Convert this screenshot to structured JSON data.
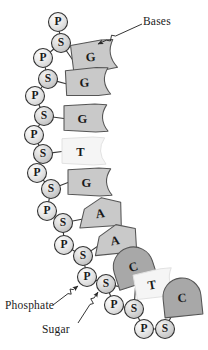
{
  "figure": {
    "background_color": "#ffffff",
    "stroke_color": "#3a3a3a",
    "text_color": "#1a1a1a"
  },
  "annotations": {
    "bases_label": "Bases",
    "phosphate_label": "Phosphate",
    "sugar_label": "Sugar"
  },
  "legend_colors": {
    "purine_fill": "#c9c9c9",
    "pyrimidine_fill": "#a8a8a8",
    "thymine_fill": "#f5f5f5",
    "phosphate_fill": "#e0e0e0",
    "sugar_fill": "#cfcfcf"
  },
  "backbone": [
    {
      "type": "P",
      "label": "P",
      "cx": 58,
      "cy": 22,
      "r": 9.5
    },
    {
      "type": "S",
      "label": "S",
      "cx": 61,
      "cy": 43,
      "r": 9.5
    },
    {
      "type": "P",
      "label": "P",
      "cx": 43,
      "cy": 58,
      "r": 9.5
    },
    {
      "type": "S",
      "label": "S",
      "cx": 48,
      "cy": 79,
      "r": 9.5
    },
    {
      "type": "P",
      "label": "P",
      "cx": 35,
      "cy": 96,
      "r": 9.5
    },
    {
      "type": "S",
      "label": "S",
      "cx": 44,
      "cy": 116,
      "r": 9.5
    },
    {
      "type": "P",
      "label": "P",
      "cx": 34,
      "cy": 135,
      "r": 9.5
    },
    {
      "type": "S",
      "label": "S",
      "cx": 43,
      "cy": 154,
      "r": 9.5
    },
    {
      "type": "P",
      "label": "P",
      "cx": 37,
      "cy": 173,
      "r": 9.5
    },
    {
      "type": "S",
      "label": "S",
      "cx": 51,
      "cy": 189,
      "r": 9.5
    },
    {
      "type": "P",
      "label": "P",
      "cx": 47,
      "cy": 211,
      "r": 9.5
    },
    {
      "type": "S",
      "label": "S",
      "cx": 63,
      "cy": 223,
      "r": 9.5
    },
    {
      "type": "P",
      "label": "P",
      "cx": 64,
      "cy": 245,
      "r": 9.5
    },
    {
      "type": "S",
      "label": "S",
      "cx": 83,
      "cy": 256,
      "r": 9.5
    },
    {
      "type": "P",
      "label": "P",
      "cx": 87,
      "cy": 277,
      "r": 9.5
    },
    {
      "type": "S",
      "label": "S",
      "cx": 106,
      "cy": 284,
      "r": 9.5
    },
    {
      "type": "P",
      "label": "P",
      "cx": 114,
      "cy": 305,
      "r": 9.5
    },
    {
      "type": "S",
      "label": "S",
      "cx": 134,
      "cy": 309,
      "r": 9.5
    },
    {
      "type": "P",
      "label": "P",
      "cx": 144,
      "cy": 329,
      "r": 9.5
    },
    {
      "type": "S",
      "label": "S",
      "cx": 165,
      "cy": 329,
      "r": 9.5
    }
  ],
  "bases": [
    {
      "label": "G",
      "shape": "flag",
      "x": 72,
      "y": 41,
      "w": 44,
      "h": 30,
      "fill": "#c9c9c9",
      "angle": -7,
      "from": 1
    },
    {
      "label": "G",
      "shape": "flag",
      "x": 66,
      "y": 68,
      "w": 44,
      "h": 28,
      "fill": "#c9c9c9",
      "angle": -3,
      "from": 3
    },
    {
      "label": "G",
      "shape": "flag",
      "x": 64,
      "y": 104,
      "w": 44,
      "h": 28,
      "fill": "#c9c9c9",
      "angle": 0,
      "from": 5
    },
    {
      "label": "T",
      "shape": "flag",
      "x": 62,
      "y": 137,
      "w": 44,
      "h": 28,
      "fill": "#f5f5f5",
      "angle": 0,
      "from": 7
    },
    {
      "label": "G",
      "shape": "flag",
      "x": 68,
      "y": 168,
      "w": 44,
      "h": 28,
      "fill": "#c9c9c9",
      "angle": 0,
      "from": 9
    },
    {
      "label": "A",
      "shape": "pentagon",
      "x": 78,
      "y": 198,
      "w": 44,
      "h": 30,
      "fill": "#c9c9c9",
      "angle": -8,
      "from": 11
    },
    {
      "label": "A",
      "shape": "pentagon",
      "x": 93,
      "y": 225,
      "w": 44,
      "h": 30,
      "fill": "#c9c9c9",
      "angle": -10,
      "from": 13
    },
    {
      "label": "C",
      "shape": "dome",
      "x": 113,
      "y": 247,
      "w": 40,
      "h": 38,
      "fill": "#a8a8a8",
      "angle": -18,
      "from": 15
    },
    {
      "label": "T",
      "shape": "flag",
      "x": 135,
      "y": 270,
      "w": 40,
      "h": 28,
      "fill": "#f5f5f5",
      "angle": -10,
      "from": 17
    },
    {
      "label": "C",
      "shape": "dome",
      "x": 163,
      "y": 278,
      "w": 38,
      "h": 38,
      "fill": "#a8a8a8",
      "angle": -6,
      "from": 19
    }
  ],
  "leaders": {
    "bases": {
      "tip_x": 98,
      "tip_y": 44,
      "tail_x": 142,
      "tail_y": 24
    },
    "phosphate": {
      "tip_x": 78,
      "tip_y": 286,
      "tail_x": 53,
      "tail_y": 305
    },
    "sugar": {
      "tip_x": 98,
      "tip_y": 292,
      "tail_x": 78,
      "tail_y": 323
    }
  }
}
